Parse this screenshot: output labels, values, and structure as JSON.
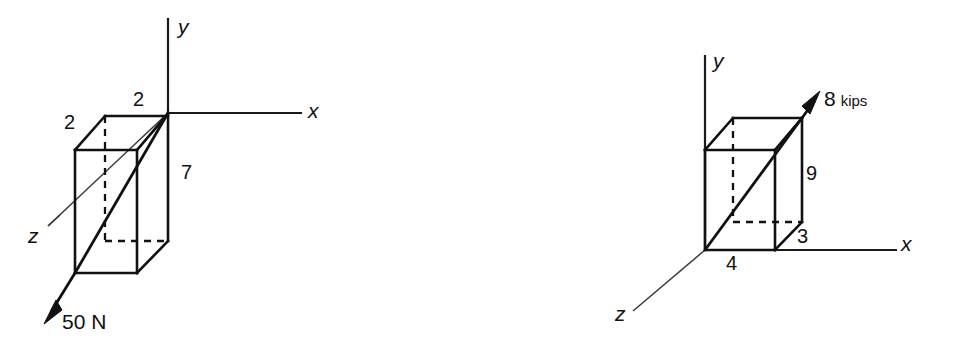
{
  "figure": {
    "type": "engineering-diagram",
    "background_color": "#ffffff",
    "line_color": "#111111"
  },
  "diagrams": [
    {
      "id": "left",
      "name": "50 N force on rectangular box",
      "axes": {
        "x_label": "x",
        "y_label": "y",
        "z_label": "z"
      },
      "dimensions": [
        {
          "value": "2",
          "name": "depth-top-left"
        },
        {
          "value": "2",
          "name": "width-top"
        },
        {
          "value": "7",
          "name": "height-right"
        }
      ],
      "force": {
        "magnitude": "50",
        "unit": "N",
        "label": "50 N",
        "direction": "down-left-out"
      }
    },
    {
      "id": "right",
      "name": "8 kips force on rectangular box",
      "axes": {
        "x_label": "x",
        "y_label": "y",
        "z_label": "z"
      },
      "dimensions": [
        {
          "value": "9",
          "name": "height-right"
        },
        {
          "value": "3",
          "name": "depth-bottom-right"
        },
        {
          "value": "4",
          "name": "width-bottom"
        }
      ],
      "force": {
        "magnitude": "8",
        "unit": "kips",
        "label": "8 kips",
        "direction": "up-right-out"
      }
    }
  ]
}
